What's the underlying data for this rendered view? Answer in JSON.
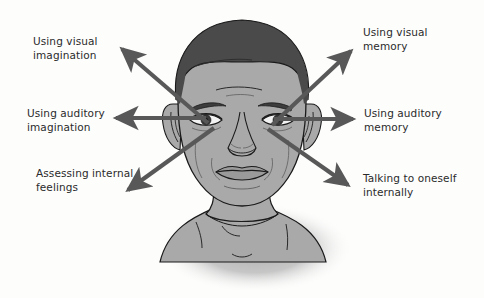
{
  "figure": {
    "background_color": "#fdfdfc",
    "arrow_color": "#585858",
    "text_color": "#2b2b2b",
    "skin_color": "#a9a9a9",
    "hair_color": "#4a4a4a",
    "outline_color": "#1a1a1a",
    "shadow_color": "#b5b5b5"
  },
  "labels": {
    "visual_imagination": "Using visual\nimagination",
    "auditory_imagination": "Using auditory\nimagination",
    "assessing_feelings": "Assessing internal\nfeelings",
    "visual_memory": "Using visual\nmemory",
    "auditory_memory": "Using auditory\nmemory",
    "talking_internally": "Talking to oneself\ninternally"
  },
  "arrows": [
    {
      "name": "arrow-visual-imagination",
      "label": "Using visual\nimagination",
      "direction": "up-left",
      "from": [
        206,
        122
      ],
      "to": [
        118,
        46
      ]
    },
    {
      "name": "arrow-auditory-imagination",
      "label": "Using auditory\nimagination",
      "direction": "left",
      "from": [
        206,
        118
      ],
      "to": [
        112,
        118
      ]
    },
    {
      "name": "arrow-assessing-feelings",
      "label": "Assessing internal\nfeelings",
      "direction": "down-left",
      "from": [
        212,
        127
      ],
      "to": [
        124,
        192
      ]
    },
    {
      "name": "arrow-visual-memory",
      "label": "Using visual\nmemory",
      "direction": "up-right",
      "from": [
        272,
        124
      ],
      "to": [
        355,
        48
      ]
    },
    {
      "name": "arrow-auditory-memory",
      "label": "Using auditory\nmemory",
      "direction": "right",
      "from": [
        272,
        119
      ],
      "to": [
        357,
        119
      ]
    },
    {
      "name": "arrow-talking-internally",
      "label": "Talking to oneself\ninternally",
      "direction": "down-right",
      "from": [
        268,
        128
      ],
      "to": [
        352,
        187
      ]
    }
  ]
}
